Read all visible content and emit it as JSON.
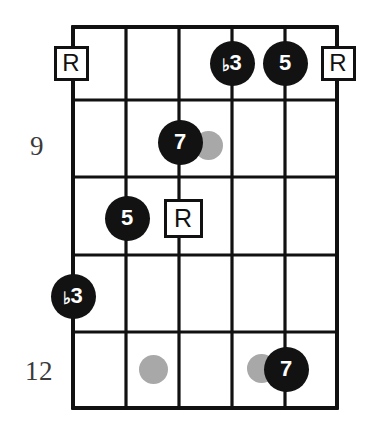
{
  "diagram": {
    "type": "guitar-fretboard-chord-diagram",
    "strings": 6,
    "frets_shown": 5,
    "string_x": [
      73,
      126,
      179,
      232,
      285,
      337
    ],
    "fret_y": [
      27,
      100,
      177,
      255,
      332,
      408
    ],
    "grid_color": "#111111",
    "marker_fill": "#121212",
    "marker_text_color": "#ffffff",
    "inlay_color": "#a8a8a8",
    "fret_numbers": [
      {
        "label": "9",
        "x": 44,
        "y": 133
      },
      {
        "label": "12",
        "x": 53,
        "y": 358
      }
    ],
    "markers": [
      {
        "name": "root-fret8-string1",
        "shape": "box",
        "label": "R",
        "degree": "R",
        "string": 1,
        "fret_row": 1,
        "cx": 71,
        "cy": 63,
        "size": 35,
        "font_size": 24
      },
      {
        "name": "flat3-fret8-string4",
        "shape": "dot",
        "label": "♭3",
        "degree": "b3",
        "string": 4,
        "fret_row": 1,
        "cx": 232,
        "cy": 63,
        "size": 45,
        "font_size": 22
      },
      {
        "name": "fifth-fret8-string5",
        "shape": "dot",
        "label": "5",
        "degree": "5",
        "string": 5,
        "fret_row": 1,
        "cx": 285,
        "cy": 63,
        "size": 45,
        "font_size": 22
      },
      {
        "name": "root-fret8-string6",
        "shape": "box",
        "label": "R",
        "degree": "R",
        "string": 6,
        "fret_row": 1,
        "cx": 338,
        "cy": 63,
        "size": 35,
        "font_size": 24
      },
      {
        "name": "inlay-fret9-upper",
        "shape": "inlay",
        "label": "",
        "cx": 208,
        "cy": 145,
        "size": 29
      },
      {
        "name": "seventh-fret9-string3",
        "shape": "dot",
        "label": "7",
        "degree": "7",
        "string": 3,
        "fret_row": 2,
        "cx": 180,
        "cy": 142,
        "size": 45,
        "font_size": 22
      },
      {
        "name": "fifth-fret10-string2",
        "shape": "dot",
        "label": "5",
        "degree": "5",
        "string": 2,
        "fret_row": 3,
        "cx": 127,
        "cy": 218,
        "size": 45,
        "font_size": 22
      },
      {
        "name": "root-fret10-string3",
        "shape": "box",
        "label": "R",
        "degree": "R",
        "string": 3,
        "fret_row": 3,
        "cx": 183,
        "cy": 218,
        "size": 39,
        "font_size": 25
      },
      {
        "name": "flat3-fret11-string1",
        "shape": "dot",
        "label": "♭3",
        "degree": "b3",
        "string": 1,
        "fret_row": 4,
        "cx": 73,
        "cy": 296,
        "size": 45,
        "font_size": 22
      },
      {
        "name": "inlay-fret12-lower-left",
        "shape": "inlay",
        "label": "",
        "cx": 153,
        "cy": 369,
        "size": 29
      },
      {
        "name": "inlay-fret12-lower-right",
        "shape": "inlay",
        "label": "",
        "cx": 261,
        "cy": 368,
        "size": 29
      },
      {
        "name": "seventh-fret12-string5",
        "shape": "dot",
        "label": "7",
        "degree": "7",
        "string": 5,
        "fret_row": 5,
        "cx": 286,
        "cy": 369,
        "size": 45,
        "font_size": 22
      }
    ]
  }
}
